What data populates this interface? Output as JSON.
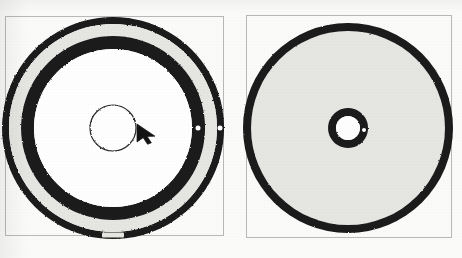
{
  "figure": {
    "title": "",
    "background_color": "#fbfbfa",
    "width": 462,
    "height": 258,
    "panel_border_color": "#b9b9b9",
    "ink_color": "#1a1a1a",
    "fill_gray": "#e6e6e3"
  },
  "panels": [
    {
      "id": "left",
      "name": "disc-top-view-left",
      "frame": {
        "x": 5,
        "y": 16,
        "width": 219,
        "height": 220
      },
      "disc": {
        "center_x": 113,
        "center_y": 128,
        "outer_rim_outer_r": 111,
        "outer_rim_inner_r": 104,
        "gray_band_outer_r": 104,
        "gray_band_inner_r": 92,
        "inner_ring_outer_r": 92,
        "inner_ring_inner_r": 79,
        "hub_r": 23,
        "hub_fill": "#ffffff",
        "band_fill": "#e6e6e3",
        "ring_color": "#1a1a1a"
      },
      "markers": [
        {
          "name": "ring-notch-right-inner",
          "angle_deg": 0,
          "radius": 85,
          "size": 5,
          "color": "#ffffff"
        },
        {
          "name": "ring-notch-right-outer",
          "angle_deg": 0,
          "radius": 107,
          "size": 5,
          "color": "#ffffff"
        },
        {
          "name": "rim-slot-bottom",
          "angle_deg": 90,
          "radius": 107,
          "width": 22,
          "height": 5,
          "color": "#e6e6e3"
        }
      ],
      "cursor": {
        "name": "mouse-pointer",
        "x": 137,
        "y": 124,
        "color": "#141414",
        "size": 18
      }
    },
    {
      "id": "right",
      "name": "disc-top-view-right",
      "frame": {
        "x": 246,
        "y": 15,
        "width": 206,
        "height": 223
      },
      "disc": {
        "center_x": 348,
        "center_y": 128,
        "outer_rim_outer_r": 105,
        "outer_rim_inner_r": 97,
        "body_fill": "#e6e6e3",
        "hub_outer_r": 20,
        "hub_inner_r": 12,
        "hub_fill": "#ffffff",
        "ring_color": "#1a1a1a"
      },
      "markers": [
        {
          "name": "hub-notch-right",
          "angle_deg": 0,
          "radius": 16,
          "size": 4,
          "color": "#ffffff"
        }
      ],
      "cursor": null
    }
  ],
  "labels": {
    "left_caption": "",
    "right_caption": ""
  }
}
